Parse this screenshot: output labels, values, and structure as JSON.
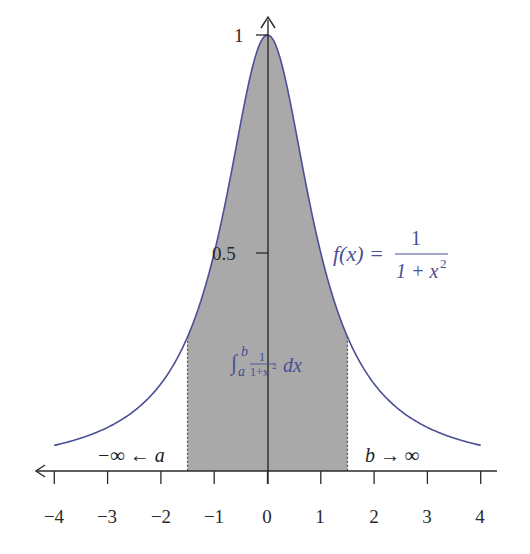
{
  "diagram": {
    "type": "function-plot",
    "function_label": {
      "lhs": "f(x) =",
      "numerator": "1",
      "denominator_base": "1 + x",
      "denominator_exp": "2"
    },
    "integral_label": {
      "symbol": "∫",
      "upper": "b",
      "lower": "a",
      "numerator": "1",
      "denominator": "1+x",
      "exp": "2",
      "dx": "dx"
    },
    "left_limit_label": "−∞ ← a",
    "right_limit_label": "b → ∞",
    "x_ticks": [
      "−4",
      "−3",
      "−2",
      "−1",
      "0",
      "1",
      "2",
      "3",
      "4"
    ],
    "y_ticks": [
      "1",
      "0.5"
    ],
    "shaded_interval": {
      "a": -1.5,
      "b": 1.5
    },
    "x_range": [
      -4,
      4
    ],
    "colors": {
      "curve": "#4a4f96",
      "shade": "#a9a9a9",
      "axis": "#2a2a2a"
    }
  },
  "chart_data": {
    "type": "area",
    "title": "",
    "function": "f(x) = 1/(1+x^2)",
    "x": [
      -4,
      -3,
      -2,
      -1.5,
      -1,
      -0.5,
      0,
      0.5,
      1,
      1.5,
      2,
      3,
      4
    ],
    "values": [
      0.0588,
      0.1,
      0.2,
      0.3077,
      0.5,
      0.8,
      1.0,
      0.8,
      0.5,
      0.3077,
      0.2,
      0.1,
      0.0588
    ],
    "shaded_region": [
      -1.5,
      1.5
    ],
    "xlabel": "",
    "ylabel": "",
    "xlim": [
      -4,
      4
    ],
    "ylim": [
      0,
      1
    ],
    "x_tick_labels": [
      "−4",
      "−3",
      "−2",
      "−1",
      "0",
      "1",
      "2",
      "3",
      "4"
    ],
    "y_tick_labels": [
      "0.5",
      "1"
    ],
    "annotations": [
      "f(x) = 1/(1+x²)",
      "∫_a^b 1/(1+x²) dx",
      "−∞ ← a",
      "b → ∞"
    ],
    "grid": false,
    "legend": "none"
  }
}
